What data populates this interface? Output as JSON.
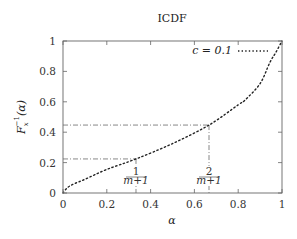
{
  "chart_data": {
    "type": "line",
    "title": "ICDF",
    "xlabel": "α",
    "ylabel": "F_x^{-1}(α)",
    "xlim": [
      0,
      1
    ],
    "ylim": [
      0,
      1
    ],
    "grid": false,
    "legend_position": "upper right",
    "x_ticks": [
      "0",
      "0.2",
      "0.4",
      "0.6",
      "0.8",
      "1"
    ],
    "y_ticks": [
      "0",
      "0.2",
      "0.4",
      "0.6",
      "0.8",
      "1"
    ],
    "series": [
      {
        "name": "c = 0.1",
        "style": "dotted",
        "x": [
          0,
          0.02,
          0.05,
          0.1,
          0.2,
          0.3333,
          0.5,
          0.6667,
          0.8,
          0.83,
          0.9,
          0.945,
          0.97,
          1.0
        ],
        "y": [
          0,
          0.035,
          0.06,
          0.09,
          0.155,
          0.224,
          0.325,
          0.447,
          0.58,
          0.61,
          0.72,
          0.86,
          0.92,
          1.0
        ]
      }
    ],
    "annotations": [
      {
        "label_num": "1",
        "label_den": "m+1",
        "x": 0.3333,
        "y": 0.224,
        "style": "dash-dot guides"
      },
      {
        "label_num": "2",
        "label_den": "m+1",
        "x": 0.6667,
        "y": 0.447,
        "style": "dash-dot guides"
      }
    ]
  },
  "labels": {
    "title": "ICDF",
    "xlabel": "α",
    "ylabel_main": "F",
    "ylabel_sub": "x",
    "ylabel_sup": "−1",
    "ylabel_arg": "(α)",
    "legend": "c = 0.1"
  }
}
